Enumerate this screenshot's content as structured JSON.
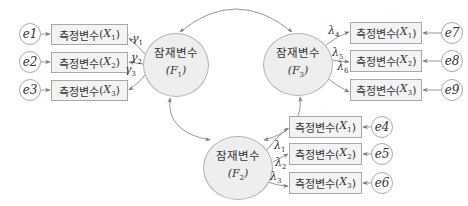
{
  "latent_variables": [
    {
      "id": "F1",
      "label": "잠재변수",
      "symbol": "F",
      "sub": "1"
    },
    {
      "id": "F2",
      "label": "잠재변수",
      "symbol": "F",
      "sub": "2"
    },
    {
      "id": "F3",
      "label": "잠재변수",
      "symbol": "F",
      "sub": "3"
    }
  ],
  "measured_groups": {
    "left": [
      {
        "label": "측정변수",
        "symbol": "X",
        "sub": "1",
        "error": "e1",
        "coef_sym": "γ",
        "coef_sub": "1"
      },
      {
        "label": "측정변수",
        "symbol": "X",
        "sub": "2",
        "error": "e2",
        "coef_sym": "γ",
        "coef_sub": "2"
      },
      {
        "label": "측정변수",
        "symbol": "X",
        "sub": "3",
        "error": "e3",
        "coef_sym": "γ",
        "coef_sub": "3"
      }
    ],
    "bottom": [
      {
        "label": "측정변수",
        "symbol": "X",
        "sub": "1",
        "error": "e4",
        "coef_sym": "λ",
        "coef_sub": "1"
      },
      {
        "label": "측정변수",
        "symbol": "X",
        "sub": "2",
        "error": "e5",
        "coef_sym": "λ",
        "coef_sub": "2"
      },
      {
        "label": "측정변수",
        "symbol": "X",
        "sub": "3",
        "error": "e6",
        "coef_sym": "λ",
        "coef_sub": "3"
      }
    ],
    "right": [
      {
        "label": "측정변수",
        "symbol": "X",
        "sub": "1",
        "error": "e7",
        "coef_sym": "λ",
        "coef_sub": "4"
      },
      {
        "label": "측정변수",
        "symbol": "X",
        "sub": "2",
        "error": "e8",
        "coef_sym": "λ",
        "coef_sub": "5"
      },
      {
        "label": "측정변수",
        "symbol": "X",
        "sub": "3",
        "error": "e9",
        "coef_sym": "λ",
        "coef_sub": "6"
      }
    ]
  },
  "colors": {
    "line": "#8c8c8c",
    "box_fill": "#f3f3f3",
    "ellipse_fill": "#eeeeee"
  }
}
